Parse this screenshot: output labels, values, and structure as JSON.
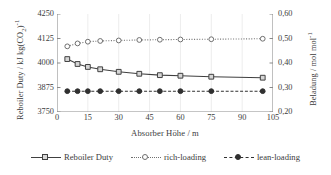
{
  "chart_data": {
    "type": "line",
    "title": "",
    "xlabel": "Absorber Höhe / m",
    "ylabel": "Reboiler Duty / kJ kg(CO2)-1",
    "ylabel_display": "Reboiler Duty / kJ kg(CO₂)⁻¹",
    "y2label": "Beladung / mol mol-1",
    "y2label_display": "Beladung / mol mol⁻¹",
    "xlim": [
      0,
      105
    ],
    "ylim": [
      3750,
      4250
    ],
    "y2lim": [
      0.2,
      0.6
    ],
    "xticks": [
      0,
      15,
      30,
      45,
      60,
      75,
      90,
      105
    ],
    "xtick_labels": [
      "0",
      "15",
      "30",
      "45",
      "60",
      "75",
      "90",
      "105"
    ],
    "yticks": [
      3750,
      3875,
      4000,
      4125,
      4250
    ],
    "ytick_labels": [
      "3750",
      "3875",
      "4000",
      "4125",
      "4250"
    ],
    "y2ticks": [
      0.2,
      0.3,
      0.4,
      0.5,
      0.6
    ],
    "y2tick_labels": [
      "0,20",
      "0,30",
      "0,40",
      "0,50",
      "0,60"
    ],
    "grid": "vertical-faint",
    "legend_position": "bottom",
    "x": [
      5,
      10,
      15,
      21,
      30,
      40,
      50,
      60,
      75,
      100
    ],
    "series": [
      {
        "name": "Reboiler Duty",
        "axis": "left",
        "line": "solid",
        "marker": "open-square",
        "color": "#404040",
        "values": [
          4020,
          3995,
          3980,
          3968,
          3955,
          3945,
          3938,
          3935,
          3930,
          3925
        ]
      },
      {
        "name": "rich-loading",
        "axis": "right",
        "line": "dotted",
        "marker": "open-circle",
        "color": "#707070",
        "values": [
          0.468,
          0.48,
          0.487,
          0.49,
          0.492,
          0.494,
          0.495,
          0.496,
          0.497,
          0.499
        ]
      },
      {
        "name": "lean-loading",
        "axis": "right",
        "line": "dashed",
        "marker": "filled-circle",
        "color": "#303030",
        "values": [
          0.285,
          0.285,
          0.285,
          0.285,
          0.285,
          0.285,
          0.285,
          0.285,
          0.285,
          0.285
        ]
      }
    ]
  },
  "legend": {
    "items": [
      {
        "label": "Reboiler Duty"
      },
      {
        "label": "rich-loading"
      },
      {
        "label": "lean-loading"
      }
    ]
  }
}
